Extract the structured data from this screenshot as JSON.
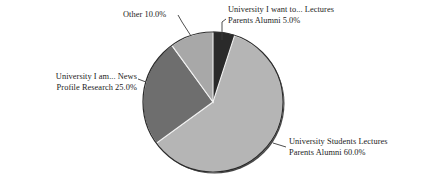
{
  "chart_data": {
    "type": "pie",
    "title": "",
    "categories": [
      "University I want to... Lectures Parents Alumni",
      "University Students Lectures Parents Alumni",
      "University I am... News Profile Research",
      "Other"
    ],
    "values": [
      5.0,
      60.0,
      25.0,
      10.0
    ],
    "value_labels": [
      "5.0%",
      "60.0%",
      "25.0%",
      "10.0%"
    ],
    "colors": [
      "#2a2a2a",
      "#b5b5b5",
      "#6e6e6e",
      "#a8a8a8"
    ],
    "start_angle_deg": 90,
    "direction": "clockwise",
    "legend": "none",
    "grid": false,
    "labels_position": "outside-with-leader-lines",
    "slices": [
      {
        "name": "want-to-slice",
        "line1": "University I want to... Lectures",
        "line2": "Parents Alumni 5.0%",
        "percent": 5.0,
        "color": "#2a2a2a"
      },
      {
        "name": "students-slice",
        "line1": "University Students Lectures",
        "line2": "Parents Alumni 60.0%",
        "percent": 60.0,
        "color": "#b5b5b5"
      },
      {
        "name": "i-am-slice",
        "line1": "University I am... News",
        "line2": "Profile Research 25.0%",
        "percent": 25.0,
        "color": "#6e6e6e"
      },
      {
        "name": "other-slice",
        "line1": "Other 10.0%",
        "line2": "",
        "percent": 10.0,
        "color": "#a8a8a8"
      }
    ]
  },
  "labels": {
    "want_line1": "University I want to... Lectures",
    "want_line2": "Parents Alumni 5.0%",
    "other_line1": "Other 10.0%",
    "am_line1": "University I am... News",
    "am_line2": "Profile Research 25.0%",
    "students_line1": "University Students Lectures",
    "students_line2": "Parents Alumni 60.0%"
  },
  "style": {
    "background": "#ffffff",
    "outline": "#2b2b2b",
    "leader_line": "#3a3a3a"
  }
}
